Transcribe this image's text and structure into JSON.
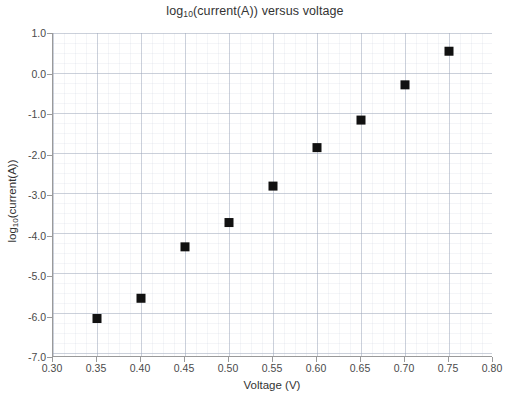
{
  "chart_data": {
    "type": "scatter",
    "title": "log10(current(A)) versus voltage",
    "title_main_pre": "log",
    "title_sub": "10",
    "title_main_post": "(current(A)) versus voltage",
    "xlabel": "Voltage (V)",
    "ylabel": "log10(current(A))",
    "ylabel_main_pre": "log",
    "ylabel_sub": "10",
    "ylabel_main_post": "(current(A))",
    "x": [
      0.35,
      0.4,
      0.45,
      0.5,
      0.55,
      0.6,
      0.65,
      0.7,
      0.75
    ],
    "values": [
      -6.05,
      -5.55,
      -4.28,
      -3.68,
      -2.78,
      -1.83,
      -1.15,
      -0.28,
      0.55
    ],
    "xlim": [
      0.3,
      0.8
    ],
    "ylim": [
      -7.0,
      1.0
    ],
    "xticks": [
      "0.30",
      "0.35",
      "0.40",
      "0.45",
      "0.50",
      "0.55",
      "0.60",
      "0.65",
      "0.70",
      "0.75",
      "0.80"
    ],
    "xtick_values": [
      0.3,
      0.35,
      0.4,
      0.45,
      0.5,
      0.55,
      0.6,
      0.65,
      0.7,
      0.75,
      0.8
    ],
    "yticks": [
      "1.0",
      "0.0",
      "-1.0",
      "-2.0",
      "-3.0",
      "-4.0",
      "-5.0",
      "-6.0",
      "-7.0"
    ],
    "ytick_values": [
      1.0,
      0.0,
      -1.0,
      -2.0,
      -3.0,
      -4.0,
      -5.0,
      -6.0,
      -7.0
    ],
    "grid": true,
    "minor_grid": true,
    "legend": null,
    "marker": "square",
    "marker_color": "#111111",
    "marker_size_px": 9,
    "axis_color": "#9a9a9a",
    "grid_color": "#aab4c8",
    "background_color": "#ffffff"
  }
}
